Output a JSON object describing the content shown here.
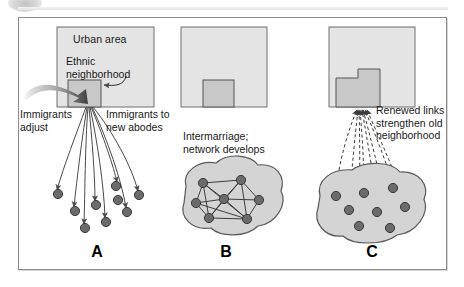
{
  "figure": {
    "title_visible": false,
    "frame_color": "#8b8b8b",
    "background": "#ffffff"
  },
  "colors": {
    "city_fill": "#e4e4e4",
    "city_stroke": "#6f6f6f",
    "neighborhood_fill": "#c8c8c8",
    "neighborhood_stroke": "#555555",
    "blob_fill": "#d4d4d4",
    "blob_stroke": "#5a5a5a",
    "node_fill": "#6b6b6b",
    "node_stroke": "#3a3a3a",
    "line": "#4a4a4a",
    "text": "#1a1a1a"
  },
  "panels": [
    {
      "id": "A",
      "letter": "A",
      "city_label": "Urban area",
      "neighborhood_label": "Ethnic neighborhood",
      "captions": [
        {
          "name": "immigrants-adjust",
          "lines": [
            "Immigrants",
            "adjust"
          ]
        },
        {
          "name": "immigrants-to-new-abodes",
          "lines": [
            "Immigrants to",
            "new abodes"
          ]
        }
      ],
      "flow": "outward-solid-arrows",
      "node_count": 9,
      "nodes": [
        {
          "x": 58,
          "y": 194
        },
        {
          "x": 75,
          "y": 211
        },
        {
          "x": 85,
          "y": 228
        },
        {
          "x": 96,
          "y": 205
        },
        {
          "x": 106,
          "y": 222
        },
        {
          "x": 118,
          "y": 200
        },
        {
          "x": 127,
          "y": 212
        },
        {
          "x": 139,
          "y": 195
        },
        {
          "x": 116,
          "y": 186
        }
      ]
    },
    {
      "id": "B",
      "letter": "B",
      "city_label": "",
      "neighborhood_label": "",
      "captions": [
        {
          "name": "intermarriage-network-develops",
          "lines": [
            "Intermarriage;",
            "network develops"
          ]
        }
      ],
      "flow": "internal-network-links",
      "node_count": 7,
      "nodes": [
        {
          "x": 203,
          "y": 183
        },
        {
          "x": 241,
          "y": 180
        },
        {
          "x": 196,
          "y": 203
        },
        {
          "x": 224,
          "y": 199
        },
        {
          "x": 259,
          "y": 200
        },
        {
          "x": 209,
          "y": 218
        },
        {
          "x": 247,
          "y": 219
        }
      ],
      "edges": [
        [
          0,
          1
        ],
        [
          0,
          2
        ],
        [
          0,
          3
        ],
        [
          0,
          5
        ],
        [
          0,
          6
        ],
        [
          1,
          3
        ],
        [
          1,
          4
        ],
        [
          1,
          5
        ],
        [
          1,
          6
        ],
        [
          2,
          3
        ],
        [
          2,
          5
        ],
        [
          2,
          6
        ],
        [
          3,
          4
        ],
        [
          3,
          5
        ],
        [
          3,
          6
        ],
        [
          4,
          6
        ],
        [
          5,
          6
        ]
      ]
    },
    {
      "id": "C",
      "letter": "C",
      "city_label": "",
      "neighborhood_label": "",
      "captions": [
        {
          "name": "renewed-links-strengthen-old-neighborhood",
          "lines": [
            "Renewed links",
            "strengthen old",
            "neighborhood"
          ]
        }
      ],
      "flow": "inward-dashed-arrows",
      "node_count": 8,
      "nodes": [
        {
          "x": 336,
          "y": 196
        },
        {
          "x": 364,
          "y": 193
        },
        {
          "x": 393,
          "y": 188
        },
        {
          "x": 349,
          "y": 210
        },
        {
          "x": 377,
          "y": 212
        },
        {
          "x": 405,
          "y": 207
        },
        {
          "x": 359,
          "y": 226
        },
        {
          "x": 390,
          "y": 228
        }
      ]
    }
  ]
}
